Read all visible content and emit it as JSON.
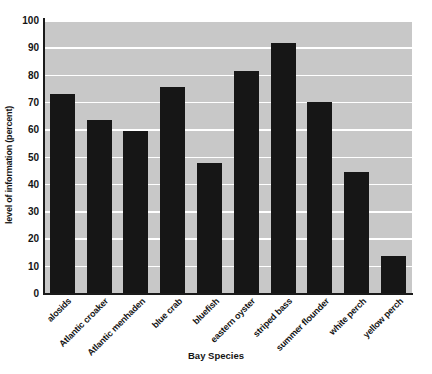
{
  "chart_data": {
    "type": "bar",
    "title": "",
    "xlabel": "Bay Species",
    "ylabel": "level of information (percent)",
    "categories": [
      "alosids",
      "Atlantic croaker",
      "Atlantic menhaden",
      "blue crab",
      "bluefish",
      "eastern oyster",
      "striped bass",
      "summer flounder",
      "white perch",
      "yellow perch"
    ],
    "values": [
      73,
      63.5,
      59.5,
      75.5,
      47.5,
      81.5,
      91.5,
      70,
      44.5,
      13.5
    ],
    "ylim": [
      0,
      100
    ],
    "ytick_labels": [
      "100",
      "90",
      "80",
      "70",
      "60",
      "50",
      "40",
      "30",
      "20",
      "10",
      "0"
    ],
    "ytick_values": [
      100,
      90,
      80,
      70,
      60,
      50,
      40,
      30,
      20,
      10,
      0
    ],
    "grid": "horizontal-white",
    "legend": "none",
    "colors": {
      "bar": "#161616",
      "plot_background": "#c8c8c8",
      "gridline": "#ffffff",
      "axis": "#1a1a1a",
      "text": "#141414",
      "figure_background": "#ffffff"
    }
  }
}
